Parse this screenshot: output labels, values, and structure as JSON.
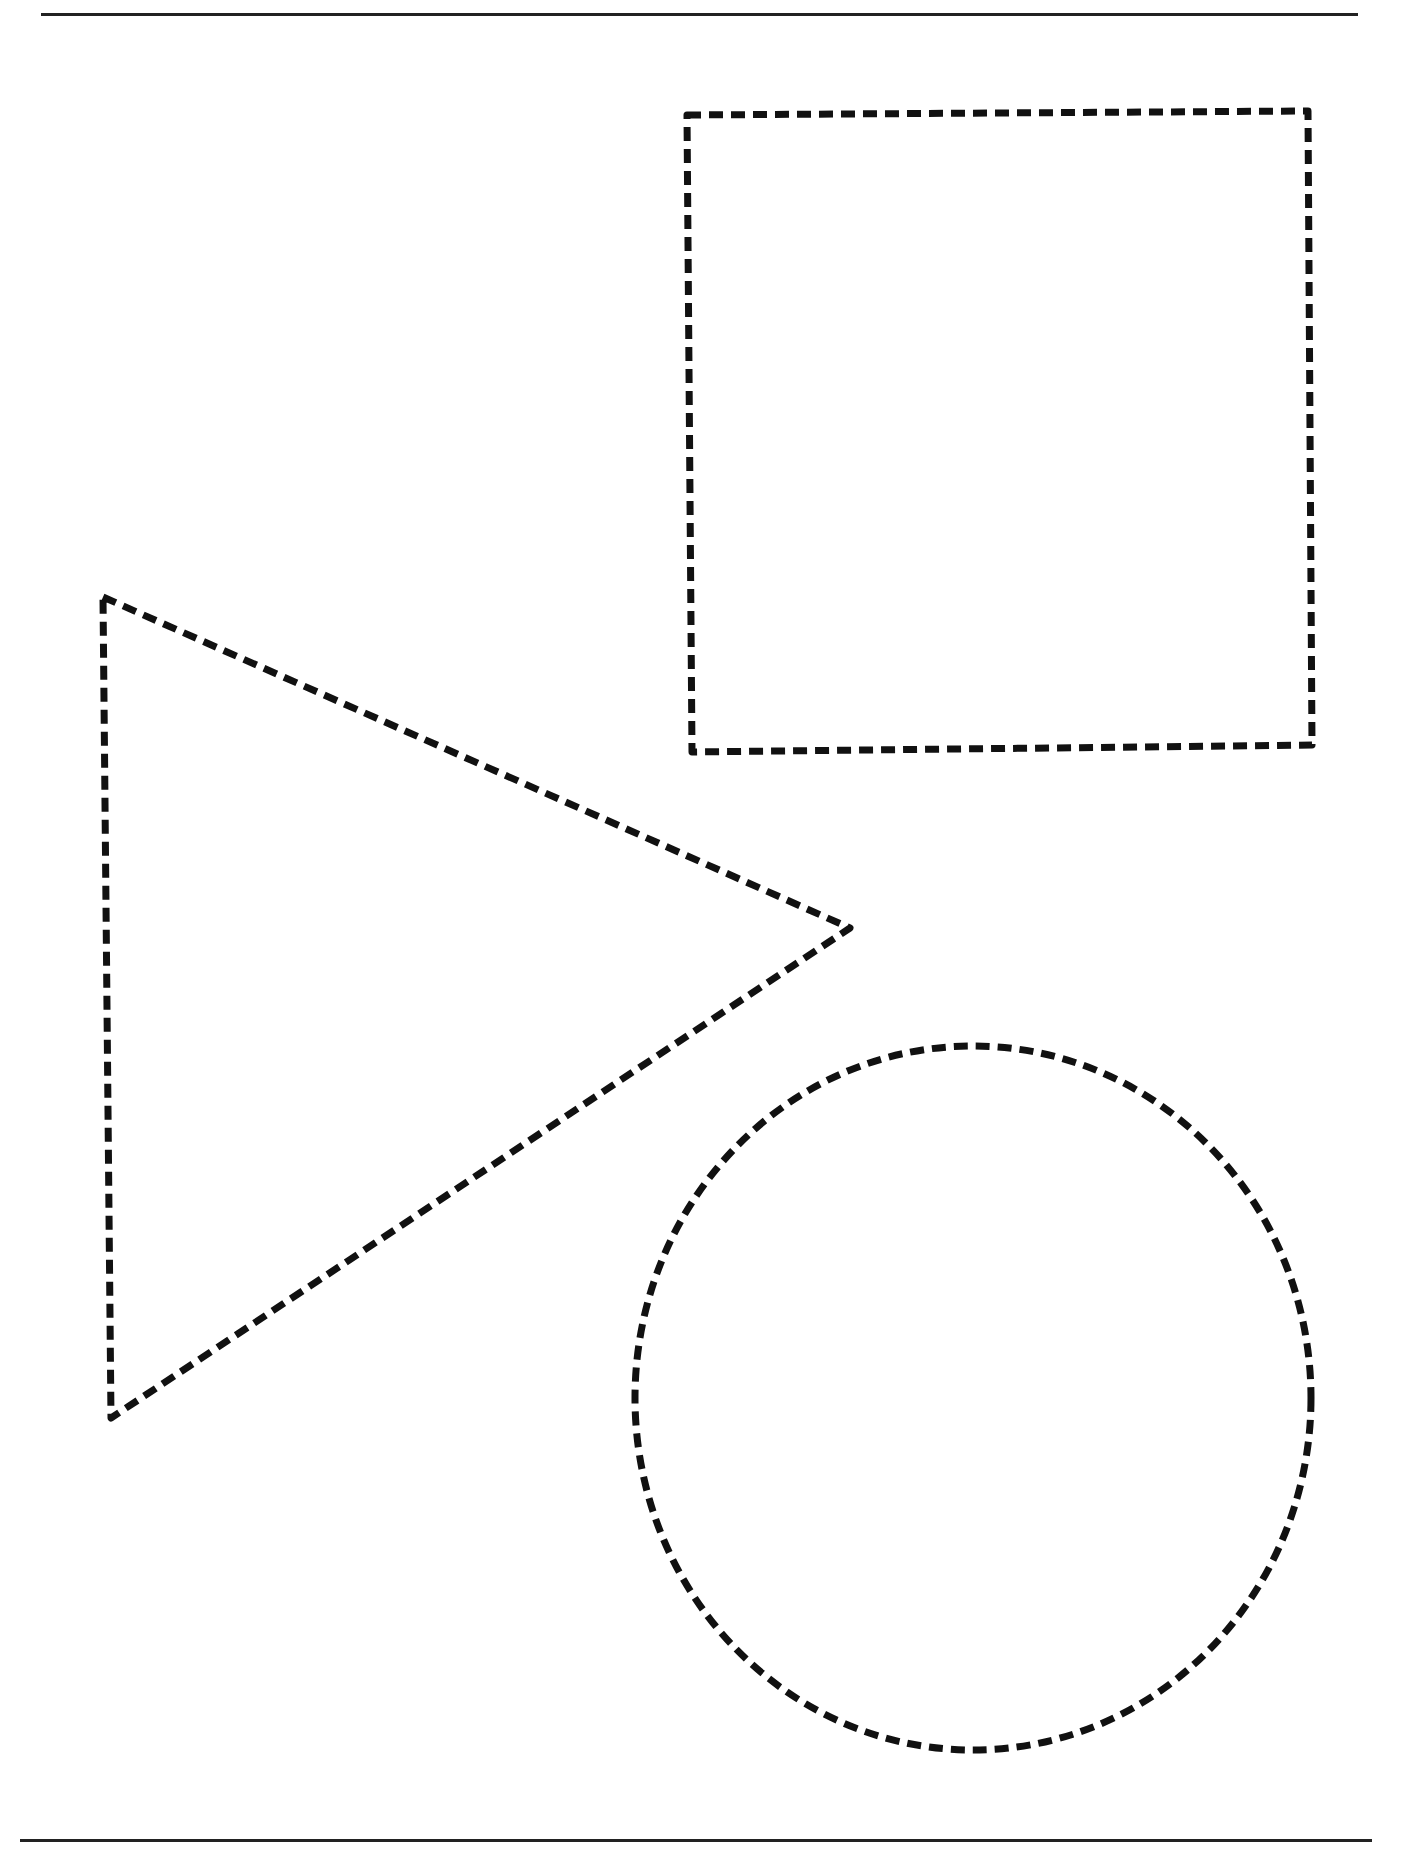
{
  "document": {
    "type": "worksheet",
    "description": "Dashed-outline shape tracing worksheet",
    "background": "#ffffff",
    "ink_color": "#111111"
  },
  "rules": {
    "top": {
      "x1": 41,
      "x2": 1358,
      "y": 14
    },
    "bottom": {
      "x1": 20,
      "x2": 1372,
      "y": 1840
    }
  },
  "stroke": {
    "width": 7,
    "dash": 14,
    "gap": 8
  },
  "shapes": [
    {
      "name": "square",
      "kind": "polygon",
      "points": "687,115 1308,111 1312,745 692,752"
    },
    {
      "name": "triangle",
      "kind": "polygon",
      "points": "103,597 850,928 111,1418"
    },
    {
      "name": "circle",
      "kind": "ellipse",
      "cx": 973,
      "cy": 1398,
      "rx": 338,
      "ry": 352
    }
  ]
}
